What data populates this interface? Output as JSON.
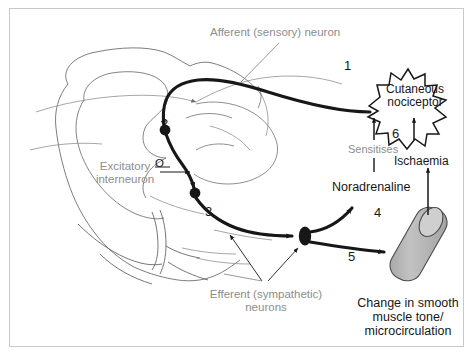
{
  "figure": {
    "type": "anatomical-diagram",
    "background_color": "#ffffff",
    "border_color": "#c9c9c9",
    "vessel_fill": "#b9b9b9",
    "ink_black": "#171717",
    "ink_gray": "#8d8d8d"
  },
  "labels": {
    "afferent": "Afferent (sensory) neuron",
    "excitatory": "Excitatory\ninterneuron",
    "excitatory_symbol": "O",
    "efferent": "Efferent (sympathetic)\nneurons",
    "nociceptor": "Cutaneous\nnociceptor",
    "sensitises": "Sensitises",
    "ischaemia": "Ischaemia",
    "noradrenaline": "Noradrenaline",
    "vessel_caption": "Change in smooth\nmuscle tone/\nmicrocirculation"
  },
  "steps": {
    "one": "1",
    "two": "2",
    "three": "3",
    "four": "4",
    "five": "5",
    "six": "6"
  }
}
